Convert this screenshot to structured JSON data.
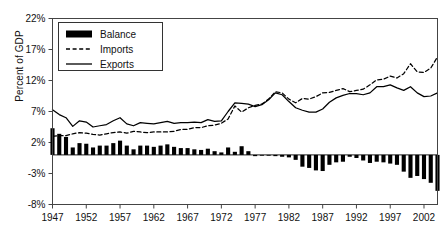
{
  "chart_data": {
    "type": "line",
    "title": "",
    "subtitle": "",
    "xlabel": "",
    "ylabel": "Percent of GDP",
    "xlim": [
      1947,
      2004
    ],
    "ylim": [
      -8,
      22
    ],
    "yticks": [
      22,
      17,
      12,
      7,
      2,
      -3,
      -8
    ],
    "ytick_labels": [
      "22%",
      "17%",
      "12%",
      "7%",
      "2%",
      "-3%",
      "-8%"
    ],
    "xticks": [
      1947,
      1952,
      1957,
      1962,
      1967,
      1972,
      1977,
      1982,
      1987,
      1992,
      1997,
      2002
    ],
    "xtick_labels": [
      "1947",
      "1952",
      "1957",
      "1962",
      "1967",
      "1972",
      "1977",
      "1982",
      "1987",
      "1992",
      "1997",
      "2002"
    ],
    "grid": false,
    "legend_position": "upper-left",
    "legend": [
      {
        "name": "Balance",
        "style": "bar",
        "color": "#000000"
      },
      {
        "name": "Imports",
        "style": "dashed",
        "color": "#000000"
      },
      {
        "name": "Exports",
        "style": "solid",
        "color": "#000000"
      }
    ],
    "x": [
      1947,
      1948,
      1949,
      1950,
      1951,
      1952,
      1953,
      1954,
      1955,
      1956,
      1957,
      1958,
      1959,
      1960,
      1961,
      1962,
      1963,
      1964,
      1965,
      1966,
      1967,
      1968,
      1969,
      1970,
      1971,
      1972,
      1973,
      1974,
      1975,
      1976,
      1977,
      1978,
      1979,
      1980,
      1981,
      1982,
      1983,
      1984,
      1985,
      1986,
      1987,
      1988,
      1989,
      1990,
      1991,
      1992,
      1993,
      1994,
      1995,
      1996,
      1997,
      1998,
      1999,
      2000,
      2001,
      2002,
      2003,
      2004
    ],
    "series": [
      {
        "name": "Exports",
        "style": "solid",
        "color": "#000000",
        "values": [
          7.3,
          6.5,
          6.0,
          4.6,
          5.5,
          5.3,
          4.5,
          4.7,
          4.9,
          5.5,
          6.0,
          5.0,
          4.7,
          5.2,
          5.1,
          5.0,
          5.2,
          5.4,
          5.1,
          5.2,
          5.2,
          5.3,
          5.2,
          5.7,
          5.4,
          5.5,
          7.0,
          8.4,
          8.3,
          8.2,
          7.8,
          8.1,
          8.9,
          10.0,
          9.7,
          8.6,
          7.6,
          7.2,
          6.9,
          6.9,
          7.4,
          8.5,
          9.2,
          9.6,
          9.9,
          9.9,
          9.7,
          10.0,
          11.0,
          11.0,
          11.3,
          10.8,
          10.4,
          11.0,
          10.0,
          9.4,
          9.5,
          10.0
        ]
      },
      {
        "name": "Imports",
        "style": "dashed",
        "color": "#000000",
        "values": [
          3.0,
          3.1,
          3.1,
          3.4,
          3.6,
          3.5,
          3.3,
          3.2,
          3.4,
          3.6,
          3.7,
          3.5,
          3.8,
          3.7,
          3.6,
          3.7,
          3.7,
          3.7,
          3.8,
          4.1,
          4.1,
          4.4,
          4.4,
          4.7,
          4.8,
          5.1,
          5.8,
          7.9,
          6.9,
          7.6,
          8.0,
          8.2,
          9.0,
          10.2,
          10.0,
          9.0,
          8.4,
          9.1,
          9.0,
          9.4,
          10.0,
          10.1,
          10.4,
          10.7,
          10.2,
          10.4,
          10.6,
          11.3,
          12.1,
          12.2,
          12.7,
          12.4,
          13.1,
          14.7,
          13.4,
          13.3,
          14.0,
          15.8
        ]
      }
    ],
    "bars": {
      "name": "Balance",
      "color": "#000000",
      "values": [
        4.3,
        3.4,
        2.9,
        1.2,
        1.9,
        1.8,
        1.2,
        1.5,
        1.5,
        1.9,
        2.3,
        1.5,
        0.9,
        1.5,
        1.5,
        1.3,
        1.5,
        1.7,
        1.3,
        1.1,
        1.1,
        0.9,
        0.8,
        1.0,
        0.6,
        0.4,
        1.2,
        0.5,
        1.4,
        0.6,
        -0.2,
        -0.1,
        -0.1,
        -0.2,
        -0.3,
        -0.4,
        -0.8,
        -1.9,
        -2.1,
        -2.5,
        -2.6,
        -1.6,
        -1.2,
        -1.1,
        -0.3,
        -0.5,
        -0.9,
        -1.3,
        -1.1,
        -1.2,
        -1.4,
        -1.6,
        -2.7,
        -3.7,
        -3.4,
        -3.9,
        -4.5,
        -5.8
      ]
    }
  }
}
